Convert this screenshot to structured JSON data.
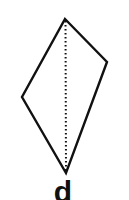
{
  "figure": {
    "shape": "kite",
    "vertices": {
      "top": [
        65,
        19
      ],
      "right": [
        107,
        62
      ],
      "bottom": [
        66,
        173
      ],
      "left": [
        22,
        97
      ]
    },
    "diagonal": {
      "from": "top",
      "to": "bottom",
      "style": "dotted"
    },
    "stroke_color": "#111111",
    "background": "#ffffff"
  },
  "label": {
    "text": "d"
  }
}
